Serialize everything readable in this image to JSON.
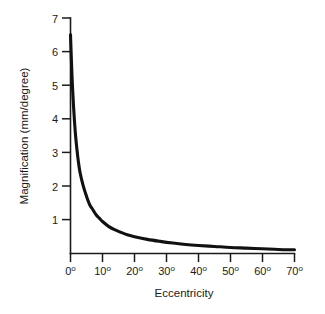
{
  "chart_data": {
    "type": "line",
    "title": "",
    "xlabel": "Eccentricity",
    "ylabel": "Magnification (mm/degree)",
    "xlim": [
      0,
      70
    ],
    "ylim": [
      0,
      7
    ],
    "grid": false,
    "legend": false,
    "x_tick_values": [
      0,
      10,
      20,
      30,
      40,
      50,
      60,
      70
    ],
    "x_tick_labels": [
      "0",
      "10",
      "20",
      "30",
      "40",
      "50",
      "60",
      "70"
    ],
    "x_tick_unit": "o",
    "y_tick_values": [
      1,
      2,
      3,
      4,
      5,
      6,
      7
    ],
    "y_tick_labels": [
      "1",
      "2",
      "3",
      "4",
      "5",
      "6",
      "7"
    ],
    "series": [
      {
        "name": "cortical magnification",
        "color": "#111111",
        "x": [
          0,
          0.5,
          1,
          1.5,
          2,
          2.5,
          3,
          4,
          5,
          6,
          7,
          8,
          9,
          10,
          12,
          14,
          16,
          18,
          20,
          24,
          28,
          32,
          36,
          40,
          45,
          50,
          55,
          60,
          65,
          70
        ],
        "y": [
          6.5,
          5.2,
          4.3,
          3.6,
          3.1,
          2.7,
          2.4,
          2.0,
          1.7,
          1.45,
          1.3,
          1.15,
          1.05,
          0.95,
          0.8,
          0.7,
          0.62,
          0.55,
          0.5,
          0.42,
          0.36,
          0.31,
          0.27,
          0.24,
          0.21,
          0.18,
          0.16,
          0.14,
          0.12,
          0.11
        ]
      }
    ],
    "annotations": []
  },
  "axis": {
    "y_title": "Magnification (mm/degree)",
    "x_title": "Eccentricity"
  },
  "colors": {
    "curve": "#111111",
    "axis": "#1b1b1b",
    "background": "#ffffff",
    "text": "#1a1a1a"
  }
}
